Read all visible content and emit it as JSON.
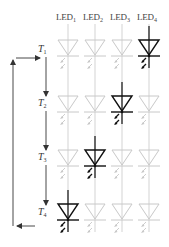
{
  "diagram": {
    "type": "led-sequence-timing",
    "columns": [
      {
        "label": "LED",
        "sub": "1",
        "x": 68
      },
      {
        "label": "LED",
        "sub": "2",
        "x": 95
      },
      {
        "label": "LED",
        "sub": "3",
        "x": 122
      },
      {
        "label": "LED",
        "sub": "4",
        "x": 149
      }
    ],
    "rows": [
      {
        "label": "T",
        "sub": "1",
        "label_y": 45,
        "diode_y": 40,
        "lit_column": 4
      },
      {
        "label": "T",
        "sub": "2",
        "label_y": 99,
        "diode_y": 96,
        "lit_column": 3
      },
      {
        "label": "T",
        "sub": "3",
        "label_y": 153,
        "diode_y": 150,
        "lit_column": 2
      },
      {
        "label": "T",
        "sub": "4",
        "label_y": 208,
        "diode_y": 204,
        "lit_column": 1
      }
    ],
    "colors": {
      "lit": "#111111",
      "unlit": "#c8c8c8",
      "arrows": "#333333"
    },
    "flow": "T1 → T2 → T3 → T4 → back to T1"
  }
}
